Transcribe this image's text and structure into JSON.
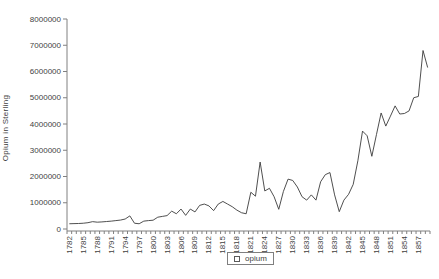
{
  "chart_data": {
    "type": "line",
    "title": "",
    "xlabel": "",
    "ylabel": "Opium in Sterling",
    "ylim": [
      0,
      8000000
    ],
    "ytick_interval": 1000000,
    "ytick_labels": [
      "0",
      "1000000",
      "2000000",
      "3000000",
      "4000000",
      "5000000",
      "6000000",
      "7000000",
      "8000000"
    ],
    "xtick_labels": [
      "1782",
      "1785",
      "1788",
      "1791",
      "1794",
      "1797",
      "1800",
      "1803",
      "1806",
      "1809",
      "1812",
      "1815",
      "1818",
      "1821",
      "1824",
      "1827",
      "1830",
      "1833",
      "1836",
      "1839",
      "1842",
      "1845",
      "1848",
      "1851",
      "1854",
      "1857"
    ],
    "x_minor_tick_every_year": true,
    "grid": false,
    "legend_position": "bottom",
    "legend": [
      "opium"
    ],
    "series": [
      {
        "name": "opium",
        "color": "#3b3b3b",
        "x": [
          1782,
          1783,
          1784,
          1785,
          1786,
          1787,
          1788,
          1789,
          1790,
          1791,
          1792,
          1793,
          1794,
          1795,
          1796,
          1797,
          1798,
          1799,
          1800,
          1801,
          1802,
          1803,
          1804,
          1805,
          1806,
          1807,
          1808,
          1809,
          1810,
          1811,
          1812,
          1813,
          1814,
          1815,
          1816,
          1817,
          1818,
          1819,
          1820,
          1821,
          1822,
          1823,
          1824,
          1825,
          1826,
          1827,
          1828,
          1829,
          1830,
          1831,
          1832,
          1833,
          1834,
          1835,
          1836,
          1837,
          1838,
          1839,
          1840,
          1841,
          1842,
          1843,
          1844,
          1845,
          1846,
          1847,
          1848,
          1849,
          1850,
          1851,
          1852,
          1853,
          1854,
          1855,
          1856,
          1857,
          1858,
          1859
        ],
        "values": [
          200000,
          205000,
          210000,
          220000,
          240000,
          280000,
          260000,
          270000,
          285000,
          300000,
          320000,
          340000,
          380000,
          500000,
          220000,
          200000,
          300000,
          320000,
          335000,
          450000,
          480000,
          510000,
          680000,
          580000,
          760000,
          520000,
          760000,
          650000,
          900000,
          950000,
          880000,
          700000,
          950000,
          1050000,
          950000,
          850000,
          720000,
          620000,
          580000,
          1400000,
          1250000,
          2550000,
          1450000,
          1550000,
          1230000,
          750000,
          1430000,
          1900000,
          1850000,
          1600000,
          1230000,
          1100000,
          1300000,
          1100000,
          1800000,
          2070000,
          2150000,
          1300000,
          660000,
          1100000,
          1320000,
          1700000,
          2600000,
          3730000,
          3550000,
          2770000,
          3600000,
          4420000,
          3920000,
          4300000,
          4690000,
          4380000,
          4400000,
          4500000,
          5000000,
          5050000,
          6800000,
          6150000
        ]
      }
    ]
  },
  "colors": {
    "background": "#ffffff",
    "axis": "#808080",
    "tick": "#808080",
    "text": "#3f3f3f",
    "line": "#3b3b3b"
  }
}
